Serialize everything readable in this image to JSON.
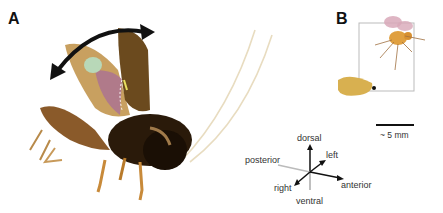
{
  "figure": {
    "panels": [
      {
        "label": "A",
        "subject": "cricket with raised wings, double-headed arrow indicating wing stroke"
      },
      {
        "label": "B",
        "subject": "fruit fly and larva with bounding box"
      }
    ],
    "orientation_axes": {
      "dorsal": "dorsal",
      "ventral": "ventral",
      "left": "left",
      "right": "right",
      "anterior": "anterior",
      "posterior": "posterior"
    },
    "scale_bar": {
      "label": "~ 5 mm"
    },
    "colors": {
      "cricket_body": "#6b4a1e",
      "cricket_wing": "#c8a060",
      "membrane": "#b07a8a",
      "green_patch": "#b8d8b8",
      "fly_body": "#e0a040",
      "fly_wing": "#d8a8b8",
      "larva": "#d8b050",
      "arrow": "#111111"
    }
  }
}
